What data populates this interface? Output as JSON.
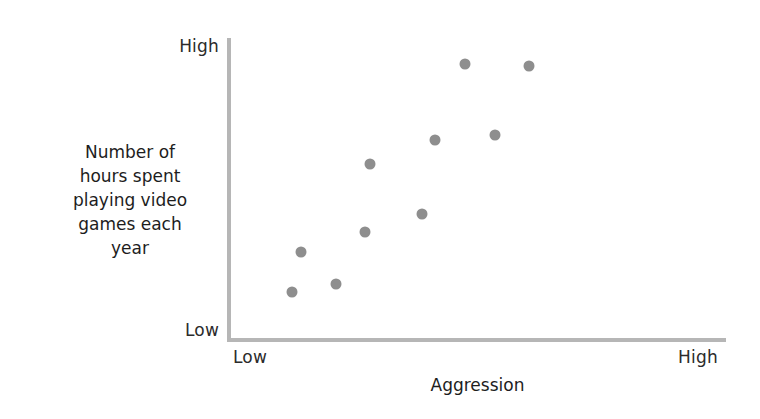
{
  "figure": {
    "width": 760,
    "height": 419,
    "background": "#ffffff"
  },
  "axes": {
    "line_color": "#b6b6b6",
    "y_axis": {
      "name": "y-axis",
      "high_label": "High",
      "low_label": "Low",
      "title_lines": [
        "Number of",
        "hours spent",
        "playing video",
        "games each",
        "year"
      ],
      "title": "Number of hours spent playing video games each year"
    },
    "x_axis": {
      "name": "x-axis",
      "low_label": "Low",
      "high_label": "High",
      "title": "Aggression"
    }
  },
  "marker": {
    "color": "#8e8e8e",
    "shape": "circle",
    "diameter_px": 11
  },
  "chart_data": {
    "type": "scatter",
    "title": "",
    "subtitle": "",
    "xlabel": "Aggression",
    "ylabel": "Number of hours spent playing video games each year",
    "xlim": [
      0,
      100
    ],
    "ylim": [
      0,
      100
    ],
    "x_tick_labels": [
      "Low",
      "High"
    ],
    "y_tick_labels": [
      "Low",
      "High"
    ],
    "grid": false,
    "legend": false,
    "n_points": 10,
    "relationship": "positive correlation",
    "points": [
      {
        "x": 12.3,
        "y": 15.3
      },
      {
        "x": 14.1,
        "y": 28.7
      },
      {
        "x": 21.2,
        "y": 18.0
      },
      {
        "x": 27.1,
        "y": 35.3
      },
      {
        "x": 28.1,
        "y": 58.0
      },
      {
        "x": 38.6,
        "y": 41.3
      },
      {
        "x": 41.2,
        "y": 66.0
      },
      {
        "x": 47.3,
        "y": 91.3
      },
      {
        "x": 53.3,
        "y": 67.7
      },
      {
        "x": 60.2,
        "y": 90.7
      }
    ]
  }
}
